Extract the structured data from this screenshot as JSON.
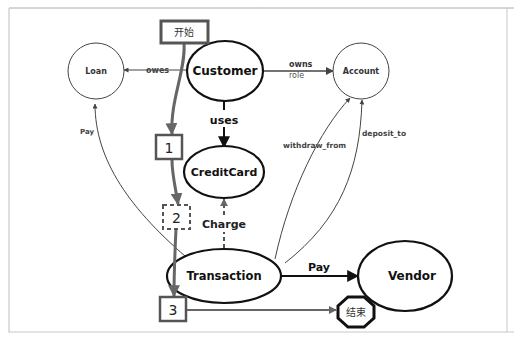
{
  "diagram": {
    "type": "entity-relationship flow diagram",
    "nodes": {
      "customer": {
        "label": "Customer",
        "shape": "ellipse",
        "style": "bold"
      },
      "loan": {
        "label": "Loan",
        "shape": "circle",
        "style": "thin"
      },
      "account": {
        "label": "Account",
        "shape": "circle",
        "style": "thin"
      },
      "creditcard": {
        "label": "CreditCard",
        "shape": "ellipse",
        "style": "bold"
      },
      "transaction": {
        "label": "Transaction",
        "shape": "ellipse",
        "style": "bold"
      },
      "vendor": {
        "label": "Vendor",
        "shape": "ellipse",
        "style": "bold"
      }
    },
    "edges": {
      "owes": {
        "label": "owes",
        "from": "Customer",
        "to": "Loan"
      },
      "owns": {
        "label": "owns",
        "sublabel": "role",
        "from": "Customer",
        "to": "Account"
      },
      "uses": {
        "label": "uses",
        "from": "Customer",
        "to": "CreditCard"
      },
      "charge": {
        "label": "Charge",
        "from": "Transaction",
        "to": "CreditCard",
        "style": "dashed"
      },
      "pay_vendor": {
        "label": "Pay",
        "from": "Transaction",
        "to": "Vendor"
      },
      "pay_loan": {
        "label": "Pay",
        "from": "Transaction",
        "to": "Loan"
      },
      "withdraw_from": {
        "label": "withdraw_from",
        "from": "Transaction",
        "to": "Account"
      },
      "deposit_to": {
        "label": "deposit_to",
        "from": "Transaction",
        "to": "Account"
      }
    },
    "flow": {
      "start": "开始",
      "end": "结束",
      "steps": [
        "1",
        "2",
        "3"
      ]
    },
    "colors": {
      "stroke": "#111111",
      "flow": "#666666",
      "thin": "#444444",
      "frame": "#bbbbbb"
    }
  }
}
